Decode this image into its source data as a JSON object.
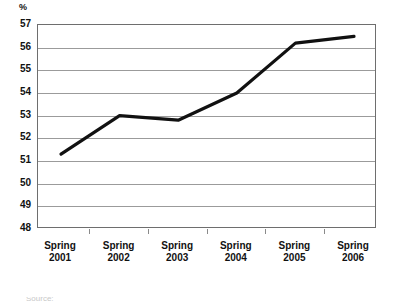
{
  "chart_data": {
    "type": "line",
    "title": "",
    "subtitle": "",
    "xlabel": "",
    "ylabel": "%",
    "unit_label": "%",
    "categories": [
      "Spring 2001",
      "Spring 2002",
      "Spring 2003",
      "Spring 2004",
      "Spring 2005",
      "Spring 2006"
    ],
    "x_tick_labels": [
      {
        "season": "Spring",
        "year": "2001"
      },
      {
        "season": "Spring",
        "year": "2002"
      },
      {
        "season": "Spring",
        "year": "2003"
      },
      {
        "season": "Spring",
        "year": "2004"
      },
      {
        "season": "Spring",
        "year": "2005"
      },
      {
        "season": "Spring",
        "year": "2006"
      }
    ],
    "values": [
      51.3,
      53.0,
      52.8,
      54.0,
      56.2,
      56.5
    ],
    "series": [
      {
        "name": "",
        "values": [
          51.3,
          53.0,
          52.8,
          54.0,
          56.2,
          56.5
        ]
      }
    ],
    "ylim": [
      48,
      57
    ],
    "y_ticks": [
      48,
      49,
      50,
      51,
      52,
      53,
      54,
      55,
      56,
      57
    ],
    "y_tick_labels": [
      "48",
      "49",
      "50",
      "51",
      "52",
      "53",
      "54",
      "55",
      "56",
      "57"
    ],
    "grid": true,
    "grid_axis": "y",
    "legend": false,
    "legend_position": "none",
    "line_color": "#111111",
    "grid_color": "#9b9b9b",
    "frame_color": "#6e6e6e",
    "markers": false,
    "annotations": []
  },
  "footnote": {
    "text": "Source:"
  }
}
